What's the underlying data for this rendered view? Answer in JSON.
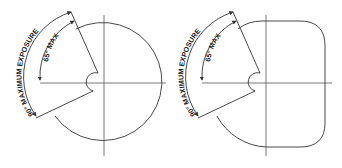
{
  "figures": [
    {
      "name": "circular-shape",
      "labels": {
        "outer_arc": "90° MAXIMUM EXPOSURE",
        "inner_arc": "65° MAX"
      }
    },
    {
      "name": "rounded-square-shape",
      "labels": {
        "outer_arc": "90° MAXIMUM EXPOSURE",
        "inner_arc": "65° MAX"
      }
    }
  ],
  "colors": {
    "line": "#333333",
    "background": "#ffffff"
  }
}
